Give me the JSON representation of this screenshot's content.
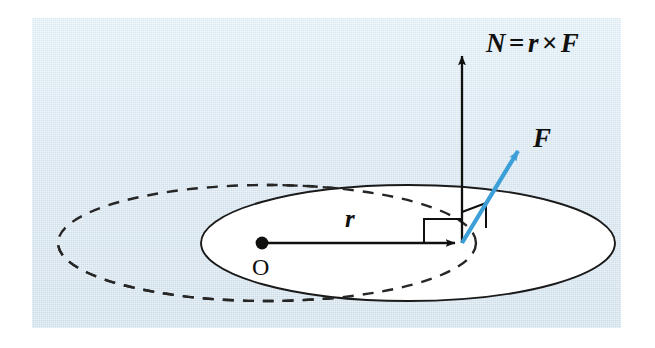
{
  "figure": {
    "type": "physics-vector-diagram",
    "background_color": "#d3e2ec",
    "page_color": "#ffffff",
    "panel": {
      "x": 32,
      "y": 18,
      "width": 589,
      "height": 310
    }
  },
  "labels": {
    "torque_vector": "N",
    "torque_equation_operator_equals": "=",
    "torque_equation_operand_r": "r",
    "torque_equation_operator_cross": "×",
    "torque_equation_operand_F": "F",
    "force_vector": "F",
    "position_vector": "r",
    "origin": "O"
  },
  "colors": {
    "ink": "#10100f",
    "force_arrow": "#3d9fd8",
    "plane_fill": "#ffffff",
    "plane_stroke": "#1a1a1a",
    "dashed_circle_stroke": "#262626",
    "panel_bg": "#d3e2ec"
  },
  "geometry": {
    "plane_ellipse": {
      "cx": 408,
      "cy": 243,
      "rx": 207,
      "ry": 58
    },
    "dashed_ellipse": {
      "cx": 267,
      "cy": 243,
      "rx": 209,
      "ry": 58
    },
    "origin_point": {
      "x": 262,
      "y": 243
    },
    "application_point": {
      "x": 462,
      "y": 243
    },
    "r_arrow": {
      "x1": 262,
      "y1": 243,
      "x2": 462,
      "y2": 243
    },
    "N_arrow": {
      "x1": 462,
      "y1": 243,
      "x2": 462,
      "y2": 52
    },
    "F_arrow": {
      "x1": 462,
      "y1": 243,
      "x2": 523,
      "y2": 143
    },
    "right_angle_marker_in_plane": {
      "x": 424,
      "y": 218,
      "size": 25
    },
    "right_angle_marker_vertical": {
      "x": 462,
      "y": 205,
      "size": 24
    }
  },
  "annotations": {
    "description": "A blue force vector F acts at the tip of position vector r measured from origin O in a white elliptical plane; the resulting torque N = r x F points vertically upward, perpendicular to the plane. A dashed ellipse indicates the circular path about the torque axis."
  }
}
